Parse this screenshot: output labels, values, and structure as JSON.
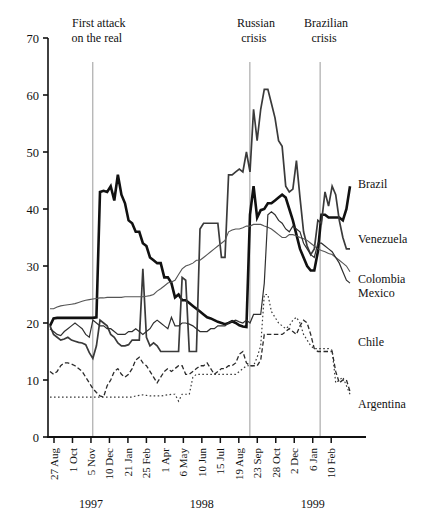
{
  "chart_data": {
    "type": "line",
    "title": "",
    "subtitle": "",
    "xlabel": "",
    "ylabel": "",
    "ylim": [
      0,
      70
    ],
    "yticks": [
      0,
      10,
      20,
      30,
      40,
      50,
      60,
      70
    ],
    "grid": false,
    "legend_position": "right-inline",
    "x_tick_labels": [
      "27 Aug",
      "1 Oct",
      "5 Nov",
      "10 Dec",
      "21 Jan",
      "25 Feb",
      "1 Apr",
      "6 May",
      "10 Jun",
      "15 Jul",
      "19 Aug",
      "23 Sep",
      "28 Oct",
      "2 Dec",
      "6 Jan",
      "10 Feb"
    ],
    "year_groups": [
      {
        "label": "1997",
        "center_tick_index": 2
      },
      {
        "label": "1998",
        "center_tick_index": 8
      },
      {
        "label": "1999",
        "center_tick_index": 14
      }
    ],
    "annotations": [
      {
        "name": "first-attack-on-the-real",
        "lines": [
          "First attack",
          "on the real"
        ],
        "x_index": 2.1
      },
      {
        "name": "russian-crisis",
        "lines": [
          "Russian",
          "crisis"
        ],
        "x_index": 10.6
      },
      {
        "name": "brazilian-crisis",
        "lines": [
          "Brazilian",
          "crisis"
        ],
        "x_index": 14.4
      }
    ],
    "series": [
      {
        "name": "Brazil",
        "style": "solid-thick",
        "color": "#111111",
        "width": 2.6,
        "label_y": 43.5,
        "values": [
          19.5,
          20.8,
          20.9,
          20.9,
          20.9,
          20.9,
          20.9,
          20.9,
          20.9,
          20.9,
          20.9,
          20.9,
          20.9,
          21.0,
          43.0,
          43.2,
          43.0,
          44.0,
          41.5,
          46.0,
          42.5,
          41.0,
          38.0,
          37.5,
          36.0,
          36.0,
          34.0,
          33.5,
          31.5,
          31.0,
          30.5,
          30.5,
          28.0,
          28.0,
          27.0,
          24.5,
          25.0,
          24.0,
          24.0,
          23.5,
          23.0,
          22.5,
          22.0,
          21.5,
          21.0,
          20.8,
          20.5,
          20.2,
          20.0,
          19.8,
          20.0,
          20.3,
          20.0,
          19.6,
          19.4,
          19.3,
          39.0,
          44.0,
          38.5,
          39.8,
          40.0,
          41.0,
          41.0,
          41.5,
          42.0,
          42.5,
          42.0,
          40.0,
          38.0,
          35.5,
          33.0,
          31.5,
          30.0,
          29.2,
          29.2,
          32.5,
          39.0,
          39.0,
          38.5,
          38.5,
          38.5,
          38.5,
          38.0,
          40.0,
          44.0
        ]
      },
      {
        "name": "Venezuela",
        "style": "solid-medium",
        "color": "#3a3a3a",
        "width": 1.7,
        "label_y": 34.5,
        "values": [
          19.5,
          18.0,
          17.5,
          17.0,
          17.2,
          17.5,
          17.0,
          16.8,
          16.6,
          16.5,
          16.2,
          14.8,
          13.8,
          16.0,
          20.5,
          20.0,
          19.5,
          18.0,
          17.5,
          16.5,
          16.0,
          16.0,
          16.2,
          17.0,
          17.0,
          17.0,
          29.5,
          17.5,
          16.0,
          16.5,
          16.0,
          15.0,
          15.0,
          15.0,
          15.0,
          15.0,
          15.0,
          28.0,
          27.5,
          15.0,
          15.0,
          15.0,
          36.5,
          37.5,
          37.5,
          37.5,
          37.5,
          37.5,
          31.5,
          31.5,
          46.0,
          46.0,
          46.5,
          47.0,
          46.5,
          50.0,
          46.5,
          57.5,
          52.0,
          57.5,
          61.0,
          61.0,
          58.5,
          56.0,
          52.0,
          51.0,
          44.0,
          43.0,
          43.5,
          48.5,
          42.0,
          36.0,
          33.5,
          32.0,
          33.0,
          38.0,
          37.5,
          43.0,
          40.5,
          44.0,
          42.5,
          38.0,
          35.0,
          33.0,
          33.0
        ]
      },
      {
        "name": "Colombia",
        "style": "solid-thin",
        "color": "#555555",
        "width": 1.1,
        "label_y": 29.0,
        "values": [
          22.5,
          22.5,
          22.8,
          23.0,
          23.1,
          23.2,
          23.3,
          23.4,
          23.6,
          23.8,
          24.0,
          24.1,
          24.2,
          24.3,
          24.4,
          24.4,
          24.5,
          24.5,
          24.5,
          24.5,
          24.5,
          24.6,
          24.6,
          24.6,
          24.6,
          24.6,
          24.6,
          24.7,
          24.8,
          25.0,
          25.6,
          26.0,
          26.5,
          27.0,
          27.2,
          27.5,
          28.5,
          29.5,
          30.0,
          30.2,
          30.5,
          31.0,
          31.0,
          31.5,
          32.0,
          32.5,
          33.0,
          33.5,
          34.0,
          34.5,
          36.0,
          36.3,
          36.5,
          36.5,
          36.7,
          37.0,
          37.0,
          37.3,
          37.3,
          37.3,
          37.0,
          36.8,
          36.5,
          36.0,
          35.5,
          35.0,
          35.0,
          35.5,
          35.5,
          35.3,
          35.0,
          34.8,
          34.5,
          34.0,
          33.5,
          33.0,
          32.7,
          32.5,
          32.2,
          32.0,
          31.5,
          31.0,
          30.5,
          30.0,
          29.0
        ]
      },
      {
        "name": "Mexico",
        "style": "solid-thin2",
        "color": "#2f2f2f",
        "width": 1.2,
        "label_y": 26.5,
        "values": [
          19.0,
          18.5,
          18.0,
          17.8,
          18.5,
          19.0,
          19.5,
          20.0,
          19.5,
          19.0,
          18.0,
          17.5,
          20.5,
          20.0,
          19.5,
          19.5,
          19.0,
          19.0,
          18.5,
          18.0,
          18.0,
          18.0,
          18.5,
          18.5,
          19.0,
          18.5,
          18.0,
          18.5,
          19.0,
          20.0,
          20.5,
          20.0,
          19.5,
          19.0,
          21.0,
          19.5,
          19.5,
          20.0,
          20.0,
          19.8,
          19.5,
          19.0,
          18.5,
          18.5,
          18.5,
          19.0,
          19.0,
          19.5,
          19.5,
          19.5,
          20.0,
          20.3,
          20.5,
          20.2,
          20.0,
          20.5,
          20.0,
          21.5,
          21.5,
          21.5,
          27.0,
          39.0,
          39.5,
          39.0,
          38.0,
          37.5,
          36.5,
          36.0,
          37.0,
          36.5,
          36.0,
          34.0,
          33.0,
          32.0,
          31.5,
          34.0,
          34.0,
          33.5,
          33.0,
          32.5,
          31.5,
          30.5,
          29.0,
          27.5,
          27.0
        ]
      },
      {
        "name": "Chile",
        "style": "dashed",
        "color": "#2a2a2a",
        "width": 1.3,
        "label_y": 18.5,
        "values": [
          11.5,
          11.0,
          11.5,
          12.5,
          13.0,
          13.0,
          12.8,
          12.5,
          12.0,
          11.5,
          10.5,
          9.5,
          8.5,
          7.8,
          7.2,
          7.0,
          9.0,
          10.0,
          11.5,
          12.0,
          11.0,
          10.5,
          11.0,
          12.0,
          13.5,
          14.0,
          13.0,
          12.5,
          11.5,
          10.5,
          9.5,
          10.5,
          11.5,
          12.0,
          11.5,
          12.0,
          12.5,
          12.5,
          11.0,
          11.0,
          11.5,
          12.0,
          12.5,
          12.5,
          13.0,
          12.0,
          11.0,
          11.5,
          12.0,
          12.0,
          12.5,
          12.5,
          13.0,
          14.5,
          15.0,
          13.0,
          12.5,
          12.5,
          12.5,
          13.5,
          18.0,
          18.0,
          18.0,
          18.0,
          18.0,
          18.0,
          18.5,
          19.0,
          18.5,
          18.0,
          19.5,
          20.5,
          20.0,
          18.0,
          15.5,
          15.0,
          15.0,
          15.0,
          15.0,
          15.0,
          11.5,
          9.5,
          10.0,
          10.0,
          8.0
        ]
      },
      {
        "name": "Argentina",
        "style": "dotted",
        "color": "#3a3a3a",
        "width": 1.2,
        "label_y": 7.0,
        "values": [
          7.0,
          7.0,
          7.0,
          7.0,
          7.0,
          7.0,
          7.0,
          7.0,
          7.0,
          7.0,
          7.0,
          7.0,
          7.0,
          7.0,
          7.0,
          7.0,
          7.0,
          7.0,
          7.0,
          7.0,
          7.0,
          7.0,
          7.0,
          7.0,
          7.2,
          7.3,
          7.4,
          7.3,
          7.2,
          7.2,
          7.2,
          7.2,
          7.3,
          7.4,
          7.5,
          7.5,
          6.3,
          7.5,
          7.5,
          7.5,
          10.5,
          11.0,
          11.0,
          11.0,
          11.0,
          11.0,
          11.0,
          11.0,
          11.0,
          11.0,
          11.0,
          11.0,
          11.0,
          11.5,
          12.0,
          12.5,
          12.5,
          12.5,
          14.0,
          16.0,
          25.0,
          25.0,
          22.0,
          21.0,
          20.0,
          19.5,
          19.0,
          19.5,
          20.5,
          21.0,
          20.0,
          18.0,
          17.0,
          16.0,
          15.5,
          15.5,
          15.5,
          15.5,
          15.5,
          15.2,
          9.5,
          10.0,
          10.5,
          9.0,
          7.5
        ]
      }
    ]
  },
  "axes": {
    "y_tick_text": [
      "70",
      "60",
      "50",
      "40",
      "30",
      "20",
      "10",
      "0"
    ],
    "series_labels": [
      "Brazil",
      "Venezuela",
      "Colombia",
      "Mexico",
      "Chile",
      "Argentina"
    ]
  }
}
